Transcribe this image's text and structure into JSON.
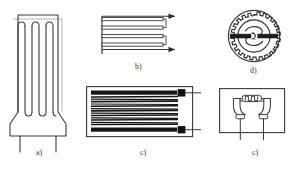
{
  "figure": {
    "background_color": "#ffffff",
    "line_color": "#3a3a3a",
    "fill_color": "#1a1a1a",
    "panels": [
      {
        "id": "a",
        "caption": "a)",
        "name": "foil-strain-gauge-with-leads",
        "description": "Rectangular foil gauge with vertical serpentine grid, tapered base and two lead wires",
        "grid_loops": 5,
        "lead_count": 2
      },
      {
        "id": "b",
        "caption": "b)",
        "name": "wire-grid-gauge-schematic",
        "description": "Horizontal serpentine wire grid with two arrow leads extending right",
        "grid_loops": 4,
        "arrow_count": 2
      },
      {
        "id": "c",
        "caption": "c)",
        "name": "foil-grid-gauge-with-solder-tabs",
        "description": "Rectangular carrier with dense horizontal filament grid and two solder tabs with lead wires",
        "filament_count": 22,
        "tab_count": 2
      },
      {
        "id": "d",
        "caption": "d)",
        "name": "rosette-strain-gauge",
        "description": "Circular rosette gauge with toothed ring, central spiral and horizontal bar",
        "teeth_count": 24
      },
      {
        "id": "e",
        "caption": "c)",
        "name": "diaphragm-strain-gauge",
        "description": "Square carrier with circular diaphragm pattern, central serpentine element and two lead wires",
        "lead_count": 2
      }
    ]
  }
}
